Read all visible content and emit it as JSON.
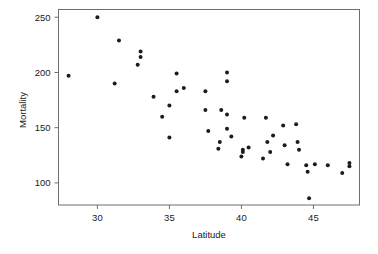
{
  "chart_data": {
    "type": "scatter",
    "title": "",
    "xlabel": "Latitude",
    "ylabel": "Mortality",
    "xlim": [
      27.3,
      48.2
    ],
    "ylim": [
      80,
      257
    ],
    "xticks": [
      30,
      35,
      40,
      45
    ],
    "yticks": [
      100,
      150,
      200,
      250
    ],
    "grid": false,
    "legend": null,
    "marker": "filled-circle",
    "marker_color": "#1c1c1c",
    "points": [
      {
        "x": 28.0,
        "y": 197
      },
      {
        "x": 30.0,
        "y": 250
      },
      {
        "x": 31.2,
        "y": 190
      },
      {
        "x": 31.5,
        "y": 229
      },
      {
        "x": 32.8,
        "y": 207
      },
      {
        "x": 33.0,
        "y": 214
      },
      {
        "x": 33.0,
        "y": 219
      },
      {
        "x": 33.9,
        "y": 178
      },
      {
        "x": 34.5,
        "y": 160
      },
      {
        "x": 35.0,
        "y": 141
      },
      {
        "x": 35.0,
        "y": 170
      },
      {
        "x": 35.5,
        "y": 199
      },
      {
        "x": 35.5,
        "y": 183
      },
      {
        "x": 36.0,
        "y": 186
      },
      {
        "x": 37.5,
        "y": 183
      },
      {
        "x": 37.5,
        "y": 166
      },
      {
        "x": 37.7,
        "y": 147
      },
      {
        "x": 38.4,
        "y": 131
      },
      {
        "x": 38.5,
        "y": 137
      },
      {
        "x": 38.6,
        "y": 166
      },
      {
        "x": 39.0,
        "y": 200
      },
      {
        "x": 39.0,
        "y": 192
      },
      {
        "x": 39.0,
        "y": 162
      },
      {
        "x": 39.0,
        "y": 149
      },
      {
        "x": 39.3,
        "y": 142
      },
      {
        "x": 40.0,
        "y": 124
      },
      {
        "x": 40.1,
        "y": 130
      },
      {
        "x": 40.1,
        "y": 128
      },
      {
        "x": 40.2,
        "y": 159
      },
      {
        "x": 40.5,
        "y": 132
      },
      {
        "x": 41.5,
        "y": 122
      },
      {
        "x": 41.7,
        "y": 159
      },
      {
        "x": 41.8,
        "y": 137
      },
      {
        "x": 42.0,
        "y": 128
      },
      {
        "x": 42.2,
        "y": 143
      },
      {
        "x": 42.9,
        "y": 152
      },
      {
        "x": 43.0,
        "y": 134
      },
      {
        "x": 43.2,
        "y": 117
      },
      {
        "x": 43.8,
        "y": 153
      },
      {
        "x": 43.9,
        "y": 137
      },
      {
        "x": 44.0,
        "y": 130
      },
      {
        "x": 44.5,
        "y": 116
      },
      {
        "x": 44.6,
        "y": 110
      },
      {
        "x": 44.7,
        "y": 86
      },
      {
        "x": 45.1,
        "y": 117
      },
      {
        "x": 46.0,
        "y": 116
      },
      {
        "x": 47.0,
        "y": 109
      },
      {
        "x": 47.5,
        "y": 115
      },
      {
        "x": 47.5,
        "y": 118
      }
    ]
  },
  "axes": {
    "x_tick_labels": [
      "30",
      "35",
      "40",
      "45"
    ],
    "y_tick_labels": [
      "100",
      "150",
      "200",
      "250"
    ],
    "x_title": "Latitude",
    "y_title": "Mortality"
  }
}
